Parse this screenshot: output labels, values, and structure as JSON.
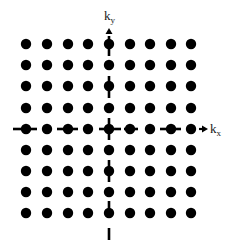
{
  "diagram": {
    "title": "",
    "colors": {
      "background": "#ffffff",
      "dot": "#000000",
      "axis": "#000000",
      "label": "#1a1a1a"
    },
    "lattice": {
      "rows": 9,
      "cols": 9,
      "x_positions": [
        26,
        47,
        68,
        88,
        109,
        130,
        150,
        171,
        191
      ],
      "y_positions": [
        44,
        65,
        86,
        108,
        129,
        150,
        171,
        192,
        213
      ],
      "dot_radius": 5.2
    },
    "axes": {
      "kx": {
        "label_main": "k",
        "label_sub": "x",
        "y": 129,
        "dashes": [
          [
            13,
            37
          ],
          [
            57,
            78
          ],
          [
            99,
            121
          ],
          [
            124,
            138
          ],
          [
            160,
            181
          ]
        ],
        "arrow_tail": 199,
        "arrow_tip": 208
      },
      "ky": {
        "label_main": "k",
        "label_sub": "y",
        "x": 109,
        "dashes": [
          [
            36,
            56
          ],
          [
            76,
            98
          ],
          [
            118,
            140
          ],
          [
            160,
            182
          ],
          [
            201,
            214
          ],
          [
            228,
            240
          ]
        ],
        "arrow_tail": 38,
        "arrow_tip": 28
      }
    }
  }
}
